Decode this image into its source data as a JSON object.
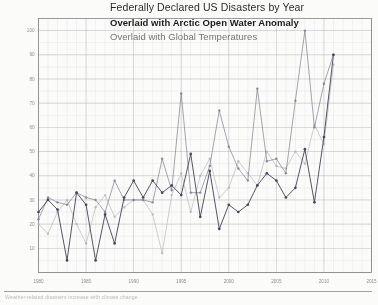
{
  "title": {
    "line1": "Federally Declared US Disasters by Year",
    "line2": "Overlaid with Arctic Open Water Anomaly",
    "line3": "Overlaid with Global Temperatures"
  },
  "footer": {
    "note": "Weather-related disasters increase with climate change",
    "note_right": ""
  },
  "colors": {
    "disasters": "#3a3a52",
    "arctic": "#7d7d8c",
    "global": "#b0b0b4",
    "grid_minor": "#d9d9dd",
    "grid_major": "#a9a9b0",
    "axis": "#6f6f76",
    "paper": "#fbfbf9"
  },
  "chart_data": {
    "type": "line",
    "title": "Federally Declared US Disasters by Year",
    "subtitle": "Overlaid with Arctic Open Water Anomaly / Overlaid with Global Temperatures",
    "xlabel": "",
    "ylabel": "",
    "grid": true,
    "legend": "none",
    "xlim": [
      1980,
      2015
    ],
    "ylim": [
      0,
      105
    ],
    "xticks": [
      1980,
      1985,
      1990,
      1995,
      2000,
      2005,
      2010,
      2015
    ],
    "xtick_labels": [
      "1980",
      "1985",
      "1990",
      "1995",
      "2000",
      "2005",
      "2010",
      "2015"
    ],
    "yticks": [
      10,
      20,
      30,
      40,
      50,
      60,
      70,
      80,
      90,
      100
    ],
    "ytick_labels": [
      "10",
      "20",
      "30",
      "40",
      "50",
      "60",
      "70",
      "80",
      "90",
      "100"
    ],
    "x": [
      1980,
      1981,
      1982,
      1983,
      1984,
      1985,
      1986,
      1987,
      1988,
      1989,
      1990,
      1991,
      1992,
      1993,
      1994,
      1995,
      1996,
      1997,
      1998,
      1999,
      2000,
      2001,
      2002,
      2003,
      2004,
      2005,
      2006,
      2007,
      2008,
      2009,
      2010,
      2011
    ],
    "series": [
      {
        "name": "Federally Declared US Disasters",
        "color": "#3a3a52",
        "values": [
          25,
          30,
          26,
          5,
          33,
          28,
          5,
          24,
          12,
          31,
          38,
          31,
          38,
          33,
          36,
          32,
          49,
          23,
          42,
          18,
          28,
          25,
          28,
          36,
          41,
          38,
          31,
          35,
          51,
          29,
          56,
          90
        ]
      },
      {
        "name": "Arctic Open Water Anomaly",
        "color": "#7d7d8c",
        "values": [
          22,
          31,
          29,
          28,
          33,
          31,
          30,
          25,
          38,
          30,
          30,
          30,
          29,
          47,
          34,
          74,
          33,
          33,
          44,
          67,
          52,
          43,
          38,
          76,
          46,
          47,
          41,
          71,
          100,
          60,
          78,
          90
        ]
      },
      {
        "name": "Global Temperatures",
        "color": "#b0b0b4",
        "values": [
          20,
          16,
          25,
          30,
          20,
          12,
          27,
          32,
          23,
          27,
          30,
          30,
          24,
          8,
          32,
          41,
          25,
          40,
          47,
          31,
          35,
          46,
          41,
          36,
          50,
          44,
          43,
          50,
          45,
          61,
          53,
          86
        ]
      }
    ]
  }
}
